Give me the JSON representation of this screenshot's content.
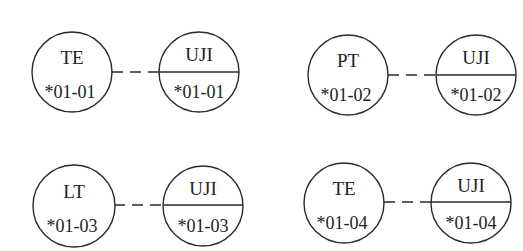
{
  "diagram": {
    "type": "entity-link pairs",
    "pairs": [
      {
        "left": {
          "label": "TE",
          "code": "*01-01",
          "cx": 72,
          "cy": 72
        },
        "right": {
          "label": "UJI",
          "code": "*01-01",
          "cx": 199,
          "cy": 72
        },
        "link": "dashed"
      },
      {
        "left": {
          "label": "PT",
          "code": "*01-02",
          "cx": 348,
          "cy": 75
        },
        "right": {
          "label": "UJI",
          "code": "*01-02",
          "cx": 476,
          "cy": 75
        },
        "link": "dashed"
      },
      {
        "left": {
          "label": "LT",
          "code": "*01-03",
          "cx": 74,
          "cy": 206
        },
        "right": {
          "label": "UJI",
          "code": "*01-03",
          "cx": 203,
          "cy": 206
        },
        "link": "dashed"
      },
      {
        "left": {
          "label": "TE",
          "code": "*01-04",
          "cx": 344,
          "cy": 203
        },
        "right": {
          "label": "UJI",
          "code": "*01-04",
          "cx": 471,
          "cy": 203
        },
        "link": "dashed"
      }
    ],
    "colors": {
      "stroke": "#2a2a2a",
      "text": "#222222",
      "background": "#ffffff"
    }
  }
}
